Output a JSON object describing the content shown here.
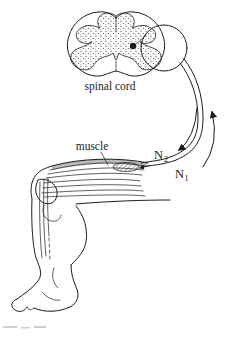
{
  "figure": {
    "background": "#ffffff",
    "line_color": "#1c1c1c",
    "type": "anatomical line diagram of a spinal reflex arc (knee/leg, muscle, spinal cord)"
  },
  "labels": {
    "spinal_cord": "spinal cord",
    "muscle": "muscle",
    "n2": {
      "base": "N",
      "sub": "2"
    },
    "n1": {
      "base": "N",
      "sub": "1"
    }
  },
  "icons": {
    "n1_arrow": "curved arrow pointing up toward spinal cord (afferent)",
    "n2_arrow": "curved arrow pointing down toward muscle (efferent)",
    "nerve_ending_arrow": "small arrow where nerve meets muscle spindle",
    "motor_neuron_soma": "filled black dot in right gray-matter horn"
  }
}
